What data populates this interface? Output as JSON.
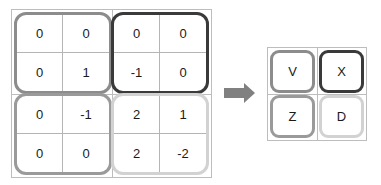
{
  "diagram": {
    "arrow": {
      "name": "right-arrow",
      "label": "maps to",
      "color": "#808080"
    },
    "frame_color": "#bdbdbd",
    "cell_divider_color": "#b5b5b5",
    "text_color": "#1a1a1a"
  },
  "matrix_grid": {
    "name": "numeric-matrix",
    "quadrants": [
      {
        "position": "top-left",
        "letter": "V",
        "border_color": "#8c8c8c",
        "rows": [
          [
            "0",
            "0"
          ],
          [
            "0",
            "1"
          ]
        ]
      },
      {
        "position": "top-right",
        "letter": "X",
        "border_color": "#3a3a3a",
        "rows": [
          [
            "0",
            "0"
          ],
          [
            "-1",
            "0"
          ]
        ]
      },
      {
        "position": "bottom-left",
        "letter": "Z",
        "border_color": "#9a9a9a",
        "rows": [
          [
            "0",
            "-1"
          ],
          [
            "0",
            "0"
          ]
        ]
      },
      {
        "position": "bottom-right",
        "letter": "D",
        "border_color": "#d2d2d2",
        "rows": [
          [
            "2",
            "1"
          ],
          [
            "2",
            "-2"
          ]
        ]
      }
    ]
  },
  "letter_grid": {
    "name": "letter-matrix",
    "quadrants": [
      {
        "position": "top-left",
        "letter": "V",
        "border_color": "#8c8c8c"
      },
      {
        "position": "top-right",
        "letter": "X",
        "border_color": "#3a3a3a"
      },
      {
        "position": "bottom-left",
        "letter": "Z",
        "border_color": "#9a9a9a"
      },
      {
        "position": "bottom-right",
        "letter": "D",
        "border_color": "#d2d2d2"
      }
    ]
  }
}
